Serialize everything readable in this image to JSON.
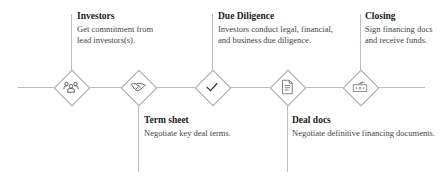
{
  "diagram": {
    "type": "process-timeline",
    "steps": [
      {
        "title": "Investors",
        "description_lines": [
          "Get commitment from",
          "lead investors(s)."
        ],
        "icon": "people-group-icon",
        "position": "above"
      },
      {
        "title": "Term sheet",
        "description_lines": [
          "Negotiate key deal terms."
        ],
        "icon": "handshake-icon",
        "position": "below"
      },
      {
        "title": "Due Diligence",
        "description_lines": [
          "Investors conduct legal, financial,",
          "and business due diligence."
        ],
        "icon": "checkmark-icon",
        "position": "above"
      },
      {
        "title": "Deal docs",
        "description_lines": [
          "Negotiate definitive financing documents."
        ],
        "icon": "document-icon",
        "position": "below"
      },
      {
        "title": "Closing",
        "description_lines": [
          "Sign financing docs",
          "and receive funds."
        ],
        "icon": "money-icon",
        "position": "above"
      }
    ],
    "colors": {
      "line": "#bdbdbd",
      "diamond_border": "#a8a8a8",
      "icon": "#555555",
      "title": "#222222",
      "text": "#444444"
    }
  }
}
